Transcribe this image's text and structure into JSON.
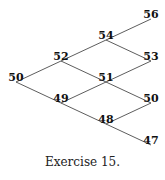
{
  "tree": {
    "levels": [
      [
        "50"
      ],
      [
        "52",
        "49"
      ],
      [
        "54",
        "51",
        "48"
      ],
      [
        "56",
        "53",
        "50",
        "47"
      ]
    ]
  },
  "caption": "Exercise 15."
}
